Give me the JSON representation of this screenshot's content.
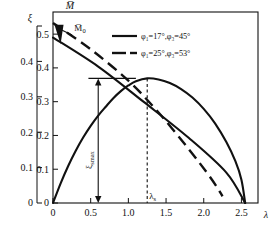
{
  "chart_data": {
    "type": "line",
    "title": "",
    "xlabel": "λ",
    "ylabel_left": "ξ",
    "ylabel_right": "M̄",
    "xlim": [
      0,
      2.72
    ],
    "ylim_left": [
      0,
      0.5
    ],
    "ylim_right": [
      0,
      0.56
    ],
    "grid": false,
    "legend_position": "top-center-inside",
    "x_ticks": [
      "0",
      "0.5",
      "1.0",
      "1.5",
      "2.0",
      "2.5"
    ],
    "x_tick_values": [
      0,
      0.5,
      1.0,
      1.5,
      2.0,
      2.5
    ],
    "y_ticks_left": [
      "0",
      "0.1",
      "0.2",
      "0.3",
      "0.4"
    ],
    "y_tick_values_left": [
      0,
      0.1,
      0.2,
      0.3,
      0.4
    ],
    "y_ticks_right": [
      "0",
      "0.1",
      "0.2",
      "0.3",
      "0.4",
      "0.5"
    ],
    "y_tick_values_right": [
      0,
      0.1,
      0.2,
      0.3,
      0.4,
      0.5
    ],
    "series": [
      {
        "name": "xi-parabola",
        "style": "solid",
        "axis": "left",
        "points": [
          [
            0.0,
            0.0
          ],
          [
            0.1,
            0.055
          ],
          [
            0.2,
            0.104
          ],
          [
            0.3,
            0.147
          ],
          [
            0.4,
            0.185
          ],
          [
            0.5,
            0.218
          ],
          [
            0.6,
            0.247
          ],
          [
            0.7,
            0.272
          ],
          [
            0.8,
            0.296
          ],
          [
            0.9,
            0.316
          ],
          [
            1.0,
            0.332
          ],
          [
            1.1,
            0.344
          ],
          [
            1.25,
            0.352
          ],
          [
            1.4,
            0.349
          ],
          [
            1.55,
            0.339
          ],
          [
            1.7,
            0.322
          ],
          [
            1.85,
            0.298
          ],
          [
            2.0,
            0.266
          ],
          [
            2.15,
            0.225
          ],
          [
            2.3,
            0.172
          ],
          [
            2.42,
            0.118
          ],
          [
            2.5,
            0.066
          ],
          [
            2.55,
            0.0
          ]
        ]
      },
      {
        "name": "M-solid",
        "style": "solid",
        "axis": "right",
        "points": [
          [
            0.0,
            0.49
          ],
          [
            0.6,
            0.404
          ],
          [
            1.2,
            0.3
          ],
          [
            1.8,
            0.193
          ],
          [
            2.3,
            0.09
          ],
          [
            2.55,
            0.0
          ]
        ]
      },
      {
        "name": "M-dashed",
        "style": "dashed",
        "axis": "right",
        "points": [
          [
            0.0,
            0.533
          ],
          [
            0.5,
            0.455
          ],
          [
            1.0,
            0.362
          ],
          [
            1.4,
            0.268
          ],
          [
            1.8,
            0.16
          ],
          [
            2.1,
            0.072
          ],
          [
            2.25,
            0.02
          ]
        ]
      }
    ],
    "legend": [
      {
        "label": "φ₁=17°,φ₃=45°",
        "style": "solid"
      },
      {
        "label": "φ₁=25°,φ₃=53°",
        "style": "dashed"
      }
    ],
    "annotations": [
      {
        "name": "M0-label",
        "text": "M̄₀",
        "x": 0.32,
        "y_px": 31
      },
      {
        "name": "xi-smax-label",
        "text": "ξₛmax",
        "x": 0.6,
        "rotated": true
      },
      {
        "name": "lambda-s-label",
        "text": "λₛ",
        "x": 1.3
      },
      {
        "name": "xi-smax-value",
        "value": 0.352
      },
      {
        "name": "lambda-s-value",
        "value": 1.25
      }
    ]
  }
}
